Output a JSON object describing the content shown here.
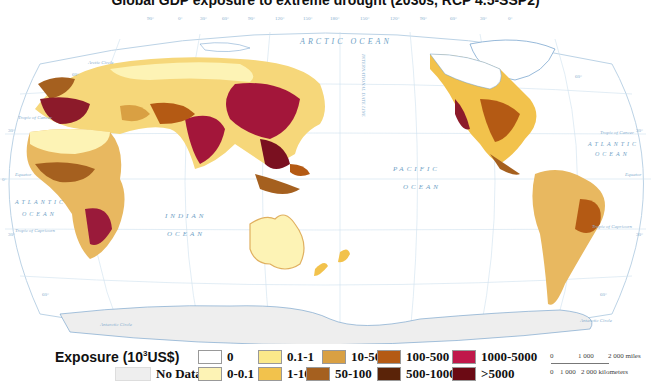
{
  "title": "Global GDP exposure to extreme drought (2030s, RCP 4.5-SSP2)",
  "map": {
    "ocean_labels": {
      "arctic": "ARCTIC OCEAN",
      "atlantic_west": [
        "ATLANTIC",
        "OCEAN"
      ],
      "atlantic_east": [
        "ATLANTIC",
        "OCEAN"
      ],
      "indian": [
        "INDIAN",
        "OCEAN"
      ],
      "pacific": [
        "PACIFIC",
        "OCEAN"
      ]
    },
    "line_labels": {
      "arctic_circle": "Arctic Circle",
      "antarctic_circle": "Antarctic Circle",
      "tropic_cancer": "Tropic of Cancer",
      "tropic_capricorn": "Tropic of Capricorn",
      "equator": "Equator",
      "date_line": "INTERNATIONAL DATE LINE"
    },
    "lat_ticks": [
      "60°",
      "30°",
      "0°",
      "30°",
      "60°"
    ],
    "lon_ticks": [
      "90°",
      "0°",
      "30°",
      "60°",
      "90°",
      "120°",
      "150°",
      "180°",
      "150°",
      "120°",
      "90°",
      "60°",
      "30°",
      "0°"
    ]
  },
  "legend": {
    "title": "Exposure (10",
    "title_sup": "3",
    "title_unit": "US$)",
    "items": [
      {
        "label": "0",
        "color": "#ffffff"
      },
      {
        "label": "0.1-1",
        "color": "#fbe98a"
      },
      {
        "label": "10-50",
        "color": "#d9a043"
      },
      {
        "label": "100-500",
        "color": "#b45a14"
      },
      {
        "label": "1000-5000",
        "color": "#c0184a"
      },
      {
        "label": "No Data",
        "color": "#eeeeee"
      },
      {
        "label": "0-0.1",
        "color": "#fdf3b5"
      },
      {
        "label": "1-10",
        "color": "#f2c24c"
      },
      {
        "label": "50-100",
        "color": "#a5601f"
      },
      {
        "label": "500-1000",
        "color": "#5a2308"
      },
      {
        "label": ">5000",
        "color": "#6b0a14"
      }
    ]
  },
  "scale_bar": {
    "miles": [
      "0",
      "1 000",
      "2 000 miles"
    ],
    "km": [
      "0",
      "1 000",
      "2 000 kilometers"
    ]
  }
}
